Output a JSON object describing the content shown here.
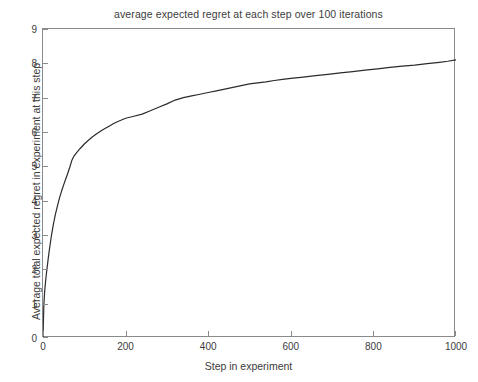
{
  "chart_data": {
    "type": "line",
    "title": "average expected regret at each step over 100 iterations",
    "xlabel": "Step in experiment",
    "ylabel": "Average total expected regret in experiment at this step",
    "xlim": [
      0,
      1000
    ],
    "ylim": [
      0,
      9
    ],
    "xticks": [
      0,
      200,
      400,
      600,
      800,
      1000
    ],
    "yticks": [
      0,
      1,
      2,
      3,
      4,
      5,
      6,
      7,
      8,
      9
    ],
    "grid": false,
    "legend": null,
    "line_color": "#2b2b2b",
    "series": [
      {
        "name": "average expected regret",
        "x": [
          0,
          2,
          4,
          6,
          8,
          10,
          13,
          16,
          20,
          25,
          30,
          35,
          40,
          45,
          50,
          55,
          60,
          65,
          70,
          75,
          80,
          90,
          100,
          110,
          120,
          130,
          140,
          150,
          160,
          170,
          180,
          190,
          200,
          220,
          240,
          260,
          280,
          300,
          320,
          340,
          360,
          380,
          400,
          420,
          440,
          460,
          480,
          500,
          520,
          540,
          560,
          580,
          600,
          630,
          660,
          690,
          720,
          750,
          780,
          810,
          840,
          870,
          900,
          930,
          960,
          980,
          1000
        ],
        "y": [
          0.0,
          0.95,
          1.35,
          1.62,
          1.85,
          2.05,
          2.35,
          2.62,
          2.95,
          3.3,
          3.6,
          3.85,
          4.08,
          4.28,
          4.46,
          4.63,
          4.8,
          4.98,
          5.18,
          5.3,
          5.38,
          5.52,
          5.65,
          5.76,
          5.86,
          5.95,
          6.03,
          6.1,
          6.17,
          6.24,
          6.3,
          6.35,
          6.4,
          6.46,
          6.52,
          6.62,
          6.72,
          6.82,
          6.93,
          7.0,
          7.05,
          7.1,
          7.15,
          7.2,
          7.25,
          7.3,
          7.35,
          7.4,
          7.43,
          7.46,
          7.5,
          7.53,
          7.56,
          7.6,
          7.64,
          7.68,
          7.72,
          7.76,
          7.8,
          7.84,
          7.88,
          7.92,
          7.95,
          7.99,
          8.03,
          8.06,
          8.1
        ]
      }
    ]
  }
}
